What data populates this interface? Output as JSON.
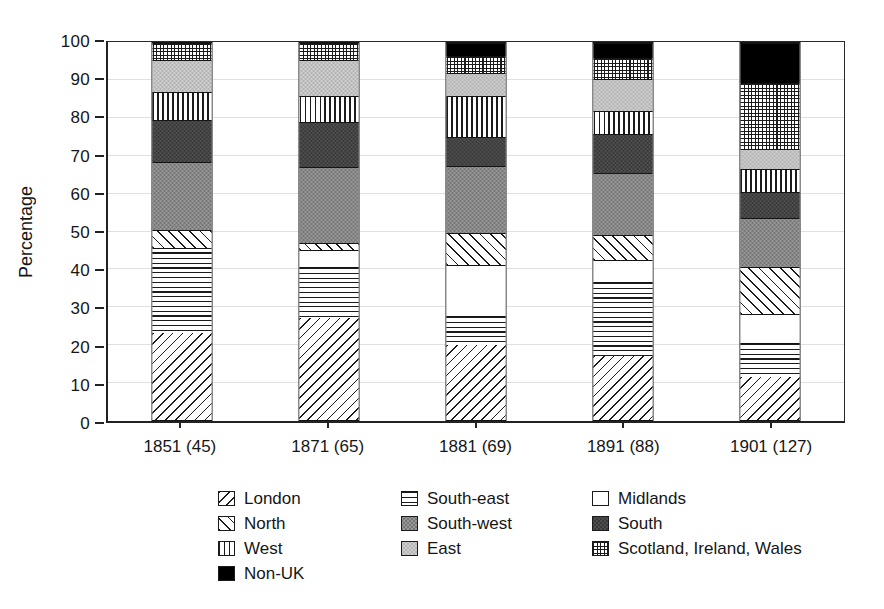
{
  "chart_data": {
    "type": "bar",
    "subtype": "stacked-percentage",
    "title": "",
    "xlabel": "",
    "ylabel": "Percentage",
    "ylim": [
      0,
      100
    ],
    "yticks": [
      0,
      10,
      20,
      30,
      40,
      50,
      60,
      70,
      80,
      90,
      100
    ],
    "grid": true,
    "legend_position": "bottom",
    "categories": [
      "1851 (45)",
      "1871 (65)",
      "1881 (69)",
      "1891 (88)",
      "1901 (127)"
    ],
    "series": [
      {
        "name": "London",
        "pattern": "london",
        "values": [
          23,
          27,
          20,
          17,
          11.5
        ]
      },
      {
        "name": "South-east",
        "pattern": "southeast",
        "values": [
          21.5,
          13.5,
          7.5,
          19.5,
          9
        ]
      },
      {
        "name": "Midlands",
        "pattern": "midlands",
        "values": [
          1,
          4.5,
          13.5,
          6,
          7.5
        ]
      },
      {
        "name": "North",
        "pattern": "north",
        "values": [
          5,
          2,
          8.5,
          6.5,
          12.5
        ]
      },
      {
        "name": "South-west",
        "pattern": "southwest",
        "values": [
          18,
          20,
          18,
          16.5,
          13
        ]
      },
      {
        "name": "South",
        "pattern": "south",
        "values": [
          11,
          12,
          7.5,
          10.5,
          7
        ]
      },
      {
        "name": "West",
        "pattern": "west",
        "values": [
          7.5,
          7,
          11,
          6,
          6
        ]
      },
      {
        "name": "East",
        "pattern": "east",
        "values": [
          8.5,
          9.5,
          6,
          8.5,
          5.5
        ]
      },
      {
        "name": "Scotland, Ireland, Wales",
        "pattern": "scotland",
        "values": [
          4.5,
          4.5,
          4.5,
          5.5,
          17.5
        ]
      },
      {
        "name": "Non-UK",
        "pattern": "nonuk",
        "values": [
          0,
          0,
          3.5,
          4,
          10.5
        ]
      }
    ],
    "colors": {
      "segment_border": "#141414",
      "gridline": "#e0e0e0",
      "dark_gray": "#3a3a3a",
      "medium_gray": "#979797",
      "light_gray": "#cecece",
      "black": "#000000"
    }
  }
}
